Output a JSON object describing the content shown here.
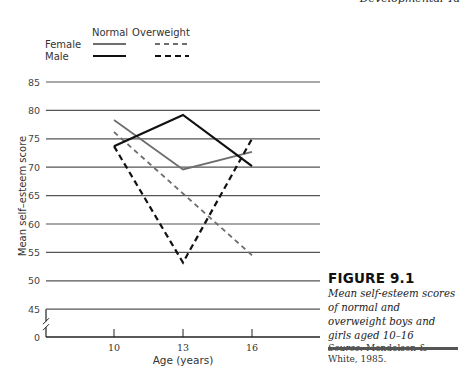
{
  "running_head": "Developmental Ta",
  "caption": {
    "figure_number": "FIGURE 9.1",
    "text": "Mean self-esteem scores of normal and overweight boys and girls aged 10–16",
    "source_label": "Source:",
    "source_text": "Mendelson & White, 1985."
  },
  "colors": {
    "female": "#6e6e6e",
    "male": "#111111",
    "grid": "#555555",
    "axis": "#222222"
  },
  "chart_data": {
    "type": "line",
    "title": "",
    "xlabel": "Age (years)",
    "ylabel": "Mean self–esteem score",
    "x": [
      10,
      13,
      16
    ],
    "x_tick_labels": [
      "10",
      "13",
      "16"
    ],
    "y_tick_labels": [
      "0",
      "45",
      "50",
      "55",
      "60",
      "65",
      "70",
      "75",
      "80",
      "85"
    ],
    "y_axis_break": "between 0 and 45",
    "ylim": [
      45,
      85
    ],
    "grid": true,
    "legend": {
      "placement": "top-left",
      "column_headers": [
        "Normal",
        "Overweight"
      ],
      "row_labels": [
        "Female",
        "Male"
      ]
    },
    "series": [
      {
        "name": "Female Normal",
        "sex": "female",
        "weight": "normal",
        "style": "solid",
        "values": [
          78.3,
          69.6,
          72.7
        ]
      },
      {
        "name": "Female Overweight",
        "sex": "female",
        "weight": "overweight",
        "style": "dashed",
        "values": [
          76.2,
          null,
          54.5
        ]
      },
      {
        "name": "Male Normal",
        "sex": "male",
        "weight": "normal",
        "style": "solid",
        "values": [
          73.7,
          79.2,
          70.2
        ]
      },
      {
        "name": "Male Overweight",
        "sex": "male",
        "weight": "overweight",
        "style": "dashed",
        "values": [
          73.7,
          53.2,
          75.0
        ]
      }
    ]
  }
}
